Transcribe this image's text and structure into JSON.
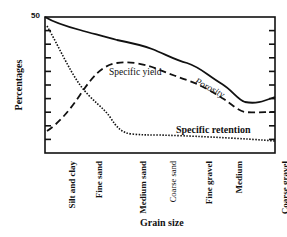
{
  "chart_data": {
    "type": "line",
    "title": "",
    "xlabel": "Grain size",
    "ylabel": "Percentages",
    "ylim": [
      0,
      50
    ],
    "ytick_labels": [
      "50"
    ],
    "yticks_count": 10,
    "grid": false,
    "legend": "inline annotations",
    "categories": [
      "Silt and clay",
      "Fine sand",
      "Medium sand",
      "Coarse sand",
      "Fine gravel",
      "Medium",
      "Coarse gravel"
    ],
    "series": [
      {
        "name": "Porosity",
        "style": "solid",
        "values": [
          50,
          44,
          41,
          37,
          31,
          24,
          19
        ]
      },
      {
        "name": "Specific yield",
        "style": "dashed",
        "values": [
          8,
          22,
          33,
          31,
          26,
          20,
          15
        ]
      },
      {
        "name": "Specific retention",
        "style": "dotted",
        "values": [
          45,
          25,
          13,
          7,
          6.5,
          5.5,
          4.5
        ]
      }
    ]
  },
  "labels": {
    "ylabel": "Percentages",
    "ytop": "50",
    "xlabel": "Grain size",
    "porosity": "Porosity",
    "specific_yield": "Specific yield",
    "specific_retention": "Specific retention",
    "cat0": "Silt and clay",
    "cat1": "Fine sand",
    "cat2": "Medium sand",
    "cat3": "Coarse sand",
    "cat4": "Fine gravel",
    "cat5": "Medium",
    "cat6": "Coarse gravel"
  }
}
